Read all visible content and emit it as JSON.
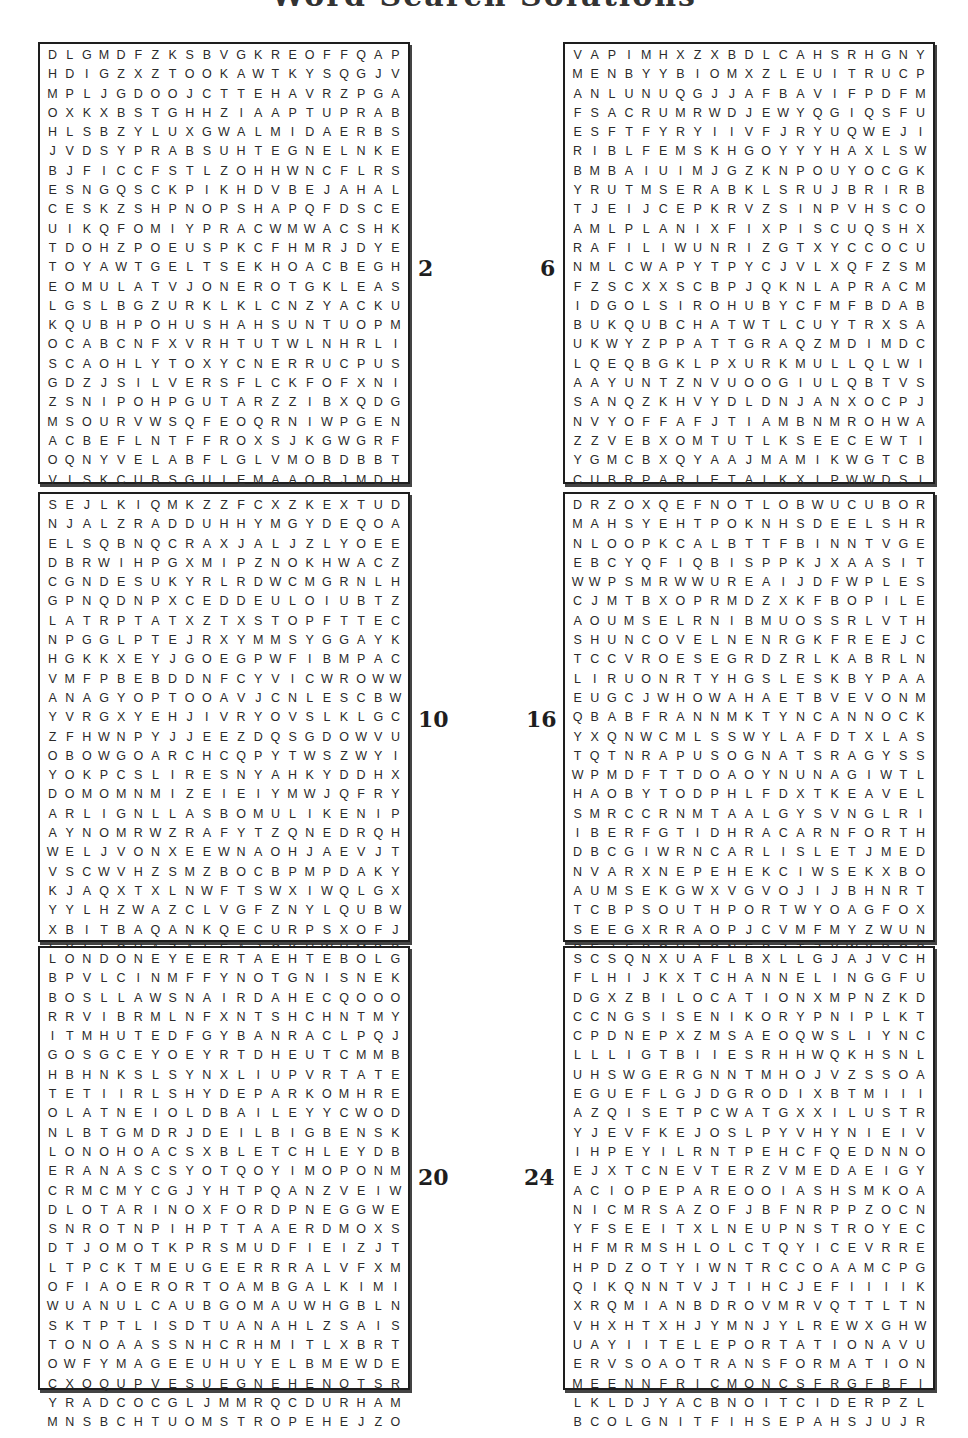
{
  "page": {
    "title": "Word Search Solutions"
  },
  "puzzles": [
    {
      "number": "2",
      "rows": [
        "DLGMDFZKSBVGKREOFFQAP",
        "HDIGZXZTOOKAWTKYSQGJV",
        "MPLJGDOOJCTTEHAVRZPGA",
        "OXKXBSTGHHZIAAPTUPRAB",
        "HLSBZYLUXGWALMIDAERBS",
        "JVDSYPRABSUHTEGNELNKE",
        "BJFICCFSTLZOHHWNCFLRS",
        "ESNGQSCKPIKHDVBEJAHAL",
        "CESKZSHPNOPSHAPQFDSCE",
        "UIKQFOMIYPRACWMWACSHK",
        "TDOHZPOEUSPKCFHMRJDYE",
        "TOYAWTGELTSEKHOACBEGH",
        "EOMULATVJONEROTGKLEAS",
        "LGSLBGZURKLKLCNZYACKU",
        "KQUBHPOHUSHAHSUNTUOPM",
        "OCABCNFXVRHTUTWLNHRLI",
        "SCAOHLYTOXYCNERRUCPUS",
        "GDZJSILVERSFLCKFOFXNI",
        "ZSNIPOHPGUTARZZIBXQDG",
        "MSOURVWSQFEOQRNIWPGEN",
        "ACBEFLNTFFROXSJKGWGRF",
        "OQNYVELABFLGLVMOBDBBT",
        "VISKCUBSGUIEMAAOBJMDH",
        "DYWVTZRHRTNTIMNYGKYJU",
        "GSQGRHCSNSGCKFNYVTTFW"
      ]
    },
    {
      "number": "6",
      "rows": [
        "VAPIMHXZXBDLCAHSRHGNY",
        "MENBYYBIOMXZLEUITRUCP",
        "ANLUNUQGJJAFBAVIFPDFM",
        "FSACRUMRWDJEWYQGIQSFU",
        "ESFTFYRYIIVFJRYUQWEJI",
        "RIBLFEMSKHGOYYYHAXLSW",
        "BMBAIUIMJGZKNPOUYOCGK",
        "YRUTMSERABKLSRUJBRIRB",
        "TJEIJCEPKRVZSINPVHSCO",
        "AMLPLANIXFIXPISCUQSHX",
        "RAFILIWUNRIZGTXYCCOCU",
        "NMLCWAPYTPYCJVLXQFZSM",
        "FZSCXXSCBPJQKNLAPRACM",
        "IDGOLSIROHUBYCFMFBDAB",
        "BUKQUBCHATWTLCUYTRXSA",
        "UKWYZPPATTGRAQZMDIMDC",
        "LQEQBGKLPXURKMULLQLWI",
        "AAYUNTZNVUOOGIULQBTVS",
        "SANQZKHVYDLDNJANXOCPJ",
        "NVYOFFAFJTIAMBNMROHWA",
        "ZZVEBXOMTUTLKSEECEWTI",
        "YGMCBXQYAAJMAMIKWGTCB",
        "CUBRPARIETALKXIPWWDSI",
        "RADIUSEIWIGCELCIVALCT",
        "BJSUREMUHCZRPRCGYXPPL"
      ]
    },
    {
      "number": "10",
      "rows": [
        "SEJLKIQMKZZFCXZKEXTUD",
        "NJALZRADDUHHYMGYDEQOA",
        "ELSQBNQCRAXJALJZLYOEE",
        "DBRWIHPGXMIPZNOKHWACZ",
        "CGNDESUKYRLRDWCMGRNLH",
        "GPNQDNPXCEDDEULOIUBTZ",
        "LATRPTATXZTXSTOPFTTEC",
        "NPGGLPTEJRXYMMSYGGAYK",
        "HGKKXEYJGOEGPWFIBMPAC",
        "VMFPBEBDDNFCYVICWROWW",
        "ANAGYOPTOOAVJCNLESCBW",
        "YVRGXYEHJIVRYOVSLKLGC",
        "ZFHWNPYJJEEZDQSGDOWVU",
        "OBOWGOARCHCQPYTWSZWYI",
        "YOKPCSLIRESNYAHKYDDHX",
        "DOMOMNMIZEIEIYMWJQFRY",
        "ARLIGNLLASBOMULIKENIP",
        "AYNOMRWZRAFYTZQNEDRQH",
        "WELJVONXEEWNAOHJAEVJT",
        "VSCWVHZSMZBOCBPMPDAKY",
        "KJAQXTXLNWFTSWXIWQLGX",
        "YYLHZWAZCLVGFZNYLQUBW",
        "XBITBAQANKQECURPSXOFJ",
        "LYLLOHAZALEAJCKUWUMBB",
        "DVWZLQOAIHTYSROFDNXFV"
      ]
    },
    {
      "number": "16",
      "rows": [
        "DRZOXQEFNOTLOBWUCUBOR",
        "MAHSYEHTPOKNHSDEELSHR",
        "NLOOPKCALBTTFBINNTVGE",
        "EBCYQFIQBISPPKJXAASIT",
        "WWPSMRWWUREAIJDFWPLES",
        "CJMTBXOPRMDZXKFBOPILE",
        "AOUMSELRNIBMUOSSRLVTH",
        "SHUNCOVELNENRGKFREEJC",
        "TCCVROESEGRDZRLKABRLN",
        "LIRUONRTYHGSLESKBYPAA",
        "EUGCJWHOWAHAETBVEVONM",
        "QBABFRANNMKTYNCANNOCK",
        "YXQNWCMLSSWYLAFDTXLAS",
        "TQTNRAPUSOGNATSRAGYSS",
        "WPMDFTTDOAOYNUNAGIWTL",
        "HAOBYTODPHLFDXTKEAVEL",
        "SMRCCRNMTAALGYSVNGLRI",
        "IBERFGTIDHRACARNFORTH",
        "DBCGIWRNCARLISLETJMED",
        "NVARXNEPEHEKCIWSEKXBO",
        "AUMSEKGWXVGVOJIJBHNRT",
        "TCBPSOUTHPORTWYOAGFOX",
        "SEEGXRRAOPJCVMFMYZWUN",
        "PEJFPQUJONEPZTZYWXDGS",
        "MTVPMGXVTNOTWENLOIAHU"
      ]
    },
    {
      "number": "20",
      "rows": [
        "LONDONEYEERTAEHTEBOLG",
        "BPVLCINMFFYNOTGNISNEK",
        "BOSLLAWSNAIRDAHECQOOO",
        "RRVIBRMLNFXNTSHCHNTMY",
        "ITMHUTEDFGYBANRACLPQJ",
        "GOSGCEYOEYRTDHEUTCMMB",
        "HBHNKSLSYNXLIUPVRTATE",
        "TETIIRLSHYDEPARKOMHRE",
        "OLATNEIOLDBAILEYYCWOD",
        "NLBTGMDRJDEILBIGBENSK",
        "LONOHOACSXBLETCHLEYDB",
        "ERANASCSYOTQOYIMOPONM",
        "CRMCMYCGJYHTPQANZVEIW",
        "DLOTARINOXFORDPNEGGWE",
        "SNROTNPIHPTTAAERDMOXS",
        "DTJOMOTKPRSMUDFIEIZJT",
        "LTPCKTMEUGEERRRALVFXM",
        "OFIAOERORTOAMBGALKIMI",
        "WUANULCAUBGOMAUWHGBLN",
        "SKTPTLISDTUANAHLZSAIS",
        "TONOAASSNHCRHMITLXBRT",
        "OWFYMAGEEUHUYELBMEWDE",
        "CXOQUPVESUEGNEHENOTSR",
        "YRADCOCGLJMMRQCDURHAM",
        "MNSBCHTUOMSTROPEHEJZO"
      ]
    },
    {
      "number": "24",
      "rows": [
        "SCSQNXUAFLBXLLGJAJVCH",
        "FLHIJKXTCHANNELINGGFU",
        "DGXZBILOCATIONXMPNZKD",
        "CCNGSISENIKORYPNIPLKT",
        "CPDNEPXZMSAEOQWSLIYNC",
        "LLLIGTBIIESRHHWQKHSNL",
        "UHSWGERGNNTMHOJVZSSOA",
        "EGUEFLGJDGRODIXBTMIII",
        "AZQISETPCWATGXXILUSTR",
        "YJEVFKEJOSLPYVHYNIEIV",
        "IHPEYILRNTPEHCFQEDNNO",
        "EJXTCNEVTERZVMEDAEIGY",
        "ACIOPEPAREOOIASHSMKOA",
        "NICMRSAZOFJBFNRPPZOCN",
        "YFSEEITXLNEUPNSTROYEC",
        "HFMRMSHLOLCTQYICEVRRE",
        "HPDZOTYIWNTRCCOAAMCPG",
        "QIKQNNTVJTIHCJEFIIIIK",
        "XRQMIANBDROVMRVQTTLTN",
        "VHXHTXHJYMNJYLREWXGHW",
        "UAYIITELEPORTATIONAVU",
        "ERVSOAOTRANSFORMATION",
        "MEENNFRICMONCSFRGFBFI",
        "LKLDJYACBNOITCIDERPZL",
        "BCOLGNITFIHSEPAHSJUJR"
      ]
    }
  ]
}
